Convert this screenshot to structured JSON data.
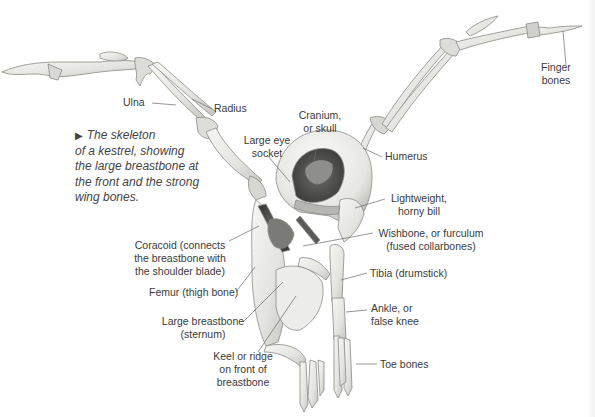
{
  "caption": {
    "arrow": "▶",
    "text": "The skeleton\nof a kestrel, showing\nthe large breastbone at\nthe front and the strong\nwing bones."
  },
  "labels": {
    "ulna": "Ulna",
    "radius": "Radius",
    "cranium": "Cranium,\nor skull",
    "eye_socket": "Large eye\nsocket",
    "humerus": "Humerus",
    "finger_bones": "Finger\nbones",
    "bill": "Lightweight,\nhorny bill",
    "wishbone": "Wishbone, or furculum\n(fused collarbones)",
    "coracoid": "Coracoid (connects\nthe breastbone with\nthe shoulder blade)",
    "tibia": "Tibia (drumstick)",
    "femur": "Femur (thigh bone)",
    "ankle": "Ankle, or\nfalse knee",
    "breastbone": "Large breastbone\n(sternum)",
    "toe_bones": "Toe bones",
    "keel": "Keel or ridge\non front of\nbreastbone"
  },
  "colors": {
    "bone_fill": "#e9e9e6",
    "bone_stroke": "#8a8a86",
    "bone_shadow": "#5a5a58",
    "leader_line": "#6a6a6a"
  }
}
